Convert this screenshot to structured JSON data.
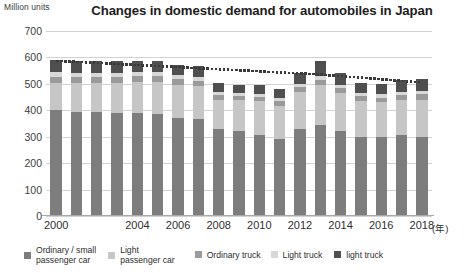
{
  "chart_data": {
    "type": "bar",
    "title": "Changes in domestic demand for automobiles in Japan",
    "subtitle": "",
    "ylabel": "Million units",
    "xlabel": "(年)",
    "ylim": [
      0,
      700
    ],
    "yticks": [
      0,
      100,
      200,
      300,
      400,
      500,
      600,
      700
    ],
    "grid": true,
    "stacked": true,
    "legend_position": "bottom",
    "categories": [
      "2000",
      "2001",
      "2002",
      "2003",
      "2004",
      "2005",
      "2006",
      "2007",
      "2008",
      "2009",
      "2010",
      "2011",
      "2012",
      "2013",
      "2014",
      "2015",
      "2016",
      "2017",
      "2018"
    ],
    "xtick_labels": [
      "2000",
      "2004",
      "2006",
      "2008",
      "2010",
      "2012",
      "2014",
      "2016",
      "2018"
    ],
    "series": [
      {
        "name": "Ordinary / small passenger car",
        "color": "#7d7d7d",
        "values": [
          400,
          395,
          392,
          390,
          388,
          385,
          372,
          368,
          330,
          320,
          305,
          290,
          330,
          345,
          320,
          300,
          300,
          305,
          300
        ]
      },
      {
        "name": "Light passenger car",
        "color": "#c6c6c6",
        "values": [
          105,
          108,
          112,
          115,
          118,
          122,
          125,
          123,
          110,
          120,
          130,
          128,
          140,
          150,
          145,
          135,
          130,
          135,
          140
        ]
      },
      {
        "name": "Ordinary truck",
        "color": "#9a9a9a",
        "values": [
          22,
          22,
          21,
          21,
          22,
          22,
          21,
          21,
          18,
          14,
          15,
          16,
          18,
          20,
          19,
          18,
          18,
          19,
          20
        ]
      },
      {
        "name": "Light truck",
        "color": "#d8d8d8",
        "values": [
          18,
          17,
          17,
          16,
          16,
          16,
          15,
          15,
          13,
          12,
          12,
          12,
          13,
          14,
          13,
          12,
          12,
          12,
          13
        ]
      },
      {
        "name": "light truck",
        "color": "#4f4f4f",
        "values": [
          47,
          45,
          45,
          44,
          42,
          42,
          40,
          40,
          34,
          31,
          33,
          34,
          42,
          57,
          45,
          38,
          38,
          42,
          45
        ]
      }
    ],
    "trendline": {
      "name": "trend",
      "style": "dotted",
      "color": "#3a3a3a",
      "values": [
        592,
        588,
        584,
        580,
        576,
        572,
        568,
        564,
        560,
        556,
        552,
        548,
        544,
        540,
        534,
        528,
        522,
        516,
        510
      ]
    }
  },
  "legend": {
    "items": [
      {
        "label": "Ordinary / small\npassenger car",
        "color": "#7d7d7d"
      },
      {
        "label": "Light\npassenger car",
        "color": "#c6c6c6"
      },
      {
        "label": "Ordinary truck",
        "color": "#9a9a9a"
      },
      {
        "label": "Light truck",
        "color": "#d8d8d8"
      },
      {
        "label": "light truck",
        "color": "#4f4f4f"
      }
    ]
  }
}
